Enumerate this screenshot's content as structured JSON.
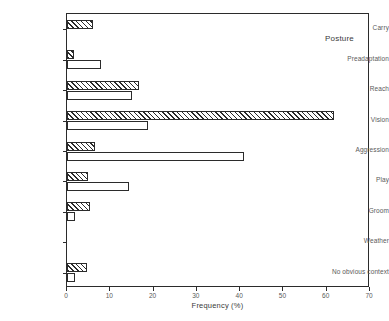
{
  "chart_data": {
    "type": "bar",
    "orientation": "horizontal",
    "title": "Posture",
    "xlabel": "Frequency (%)",
    "ylabel": "",
    "xlim": [
      0,
      70
    ],
    "xticks": [
      0,
      10,
      20,
      30,
      40,
      50,
      60,
      70
    ],
    "xticklabels": [
      "0",
      "10",
      "20",
      "30",
      "40",
      "50",
      "60",
      "70"
    ],
    "grid": false,
    "legend": null,
    "categories": [
      "Carry",
      "Preadaptation",
      "Reach",
      "Vision",
      "Aggression",
      "Play",
      "Groom",
      "Weather",
      "No obvious context"
    ],
    "series": [
      {
        "name": "hatched",
        "fill": "diagonal-hatch",
        "values": [
          6.0,
          1.6,
          16.6,
          61.7,
          6.5,
          4.8,
          5.3,
          0,
          4.6
        ]
      },
      {
        "name": "open",
        "fill": "white",
        "values": [
          0,
          7.9,
          15.0,
          18.7,
          41.0,
          14.3,
          1.8,
          0,
          1.8
        ]
      }
    ]
  },
  "style": {
    "axis_color": "#2b2b2b",
    "text_color": "#3a3a3a",
    "tick_text_color": "#5a5a5a",
    "background": "#ffffff"
  }
}
